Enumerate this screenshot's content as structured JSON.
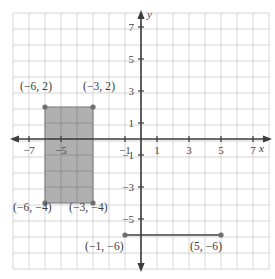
{
  "figure": {
    "background_color": "#ffffff",
    "grid_color": "#cfcfcf",
    "grid_color_minor": "#dcdcdc",
    "axis_color": "#3b3b3b",
    "shape_fill": "#a9a9a9",
    "shape_stroke": "#7c7c7c",
    "point_color": "#6e6e6e",
    "segment_color": "#6e6e6e"
  },
  "chart_data": {
    "type": "scatter",
    "title": "",
    "xlabel": "x",
    "ylabel": "y",
    "xlim": [
      -8,
      8
    ],
    "ylim": [
      -8,
      8
    ],
    "grid": true,
    "grid_step": 1,
    "legend": "none",
    "x_tick_labels": [
      "-7",
      "-5",
      "-1",
      "1",
      "3",
      "5",
      "7"
    ],
    "x_tick_values": [
      -7,
      -5,
      -1,
      1,
      3,
      5,
      7
    ],
    "y_tick_labels": [
      "7",
      "5",
      "3",
      "1",
      "-1",
      "-3",
      "-5"
    ],
    "y_tick_values": [
      7,
      5,
      3,
      1,
      -1,
      -3,
      -5
    ],
    "shapes": [
      {
        "name": "shaded-rectangle",
        "kind": "rectangle",
        "x_min": -6,
        "x_max": -3,
        "y_min": -4,
        "y_max": 2,
        "width": 3,
        "height": 6,
        "fill": "#a9a9a9",
        "vertices": [
          {
            "label": "(−6, 2)",
            "x": -6,
            "y": 2
          },
          {
            "label": "(−3, 2)",
            "x": -3,
            "y": 2
          },
          {
            "label": "(−6, −4)",
            "x": -6,
            "y": -4
          },
          {
            "label": "(−3, −4)",
            "x": -3,
            "y": -4
          }
        ]
      },
      {
        "name": "horizontal-segment",
        "kind": "segment",
        "length": 6,
        "endpoints": [
          {
            "label": "(−1, −6)",
            "x": -1,
            "y": -6
          },
          {
            "label": "(5, −6)",
            "x": 5,
            "y": -6
          }
        ]
      }
    ],
    "points": [
      {
        "label": "(−6, 2)",
        "x": -6,
        "y": 2
      },
      {
        "label": "(−3, 2)",
        "x": -3,
        "y": 2
      },
      {
        "label": "(−6, −4)",
        "x": -6,
        "y": -4
      },
      {
        "label": "(−3, −4)",
        "x": -3,
        "y": -4
      },
      {
        "label": "(−1, −6)",
        "x": -1,
        "y": -6
      },
      {
        "label": "(5, −6)",
        "x": 5,
        "y": -6
      }
    ],
    "annotations": [
      {
        "name": "label-top-left",
        "text": "(−6, 2)",
        "px": 20,
        "py": 86
      },
      {
        "name": "label-top-right",
        "text": "(−3, 2)",
        "px": 83,
        "py": 86
      },
      {
        "name": "label-bottom-left",
        "text": "(−6, −4)",
        "px": 14,
        "py": 206
      },
      {
        "name": "label-bottom-right",
        "text": "(−3, −4)",
        "px": 70,
        "py": 206
      },
      {
        "name": "label-segment-left",
        "text": "(−1, −6)",
        "px": 85,
        "py": 238
      },
      {
        "name": "label-segment-right",
        "text": "(5, −6)",
        "px": 190,
        "py": 238
      }
    ]
  },
  "axes": {
    "x_axis_label": "x",
    "y_axis_label": "y",
    "x_ticks": [
      {
        "text": "-7",
        "x": -7
      },
      {
        "text": "-5",
        "x": -5
      },
      {
        "text": "-1",
        "x": -1
      },
      {
        "text": "1",
        "x": 1
      },
      {
        "text": "3",
        "x": 3
      },
      {
        "text": "5",
        "x": 5
      },
      {
        "text": "7",
        "x": 7
      }
    ],
    "y_ticks": [
      {
        "text": "7",
        "y": 7
      },
      {
        "text": "5",
        "y": 5
      },
      {
        "text": "3",
        "y": 3
      },
      {
        "text": "1",
        "y": 1
      },
      {
        "text": "-1",
        "y": -1
      },
      {
        "text": "-3",
        "y": -3
      },
      {
        "text": "-5",
        "y": -5
      }
    ]
  }
}
